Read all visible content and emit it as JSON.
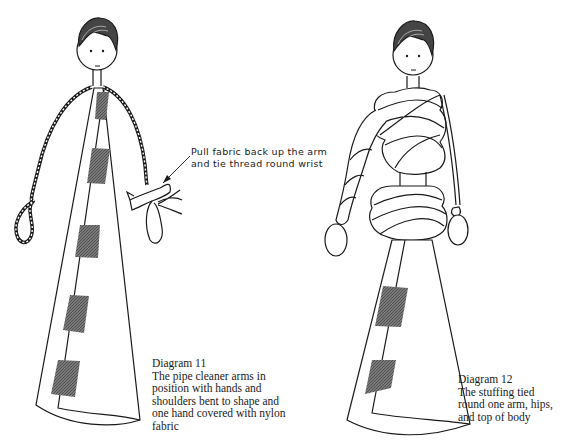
{
  "diagram_11": {
    "title": "Diagram 11",
    "caption_lines": [
      "The pipe cleaner arms in",
      "position with hands and",
      "shoulders bent to shape and",
      "one hand covered with nylon",
      "fabric"
    ],
    "callout_lines": [
      "Pull fabric back up the arm",
      "and tie thread round wrist"
    ]
  },
  "diagram_12": {
    "title": "Diagram 12",
    "caption_lines": [
      "The stuffing tied",
      "round one arm, hips,",
      "and top of body"
    ]
  },
  "colors": {
    "ink": "#1a1a1a",
    "patch": "#6e6e6e",
    "paper": "#ffffff"
  }
}
